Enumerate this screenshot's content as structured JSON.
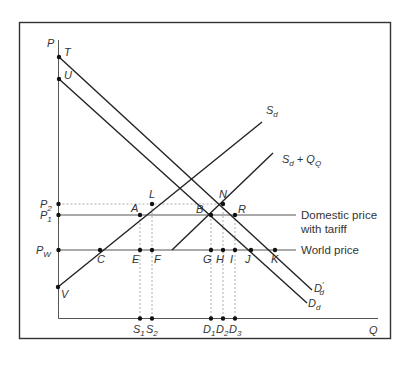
{
  "diagram": {
    "type": "tariff-quota-supply-demand",
    "axes": {
      "y_label": "P",
      "x_label": "Q"
    },
    "price_labels": [
      {
        "id": "P2",
        "main": "P",
        "sub": "2"
      },
      {
        "id": "P1",
        "main": "P",
        "sub": "1"
      },
      {
        "id": "Pw",
        "main": "P",
        "sub": "W"
      }
    ],
    "curve_labels": {
      "sd": {
        "main": "S",
        "sub": "d"
      },
      "sd_qo": {
        "main": "S",
        "sub": "d",
        "suffix": " + Q",
        "suffix_sub": "Q"
      },
      "dd": {
        "main": "D",
        "sub": "d"
      },
      "dd_prime": {
        "main": "D",
        "sub": "d",
        "prime": "′"
      }
    },
    "line_labels": {
      "domestic_price_line1": "Domestic price",
      "domestic_price_line2": "with tariff",
      "world_price": "World price"
    },
    "points": {
      "T": "T",
      "U": "U",
      "V": "V",
      "L": "L",
      "A": "A",
      "N": "N",
      "B": "B",
      "R": "R",
      "C": "C",
      "E": "E",
      "F": "F",
      "G": "G",
      "H": "H",
      "I": "I",
      "J": "J",
      "K": "K"
    },
    "quantity_labels": [
      {
        "id": "S1",
        "main": "S",
        "sub": "1"
      },
      {
        "id": "S2",
        "main": "S",
        "sub": "2"
      },
      {
        "id": "D1",
        "main": "D",
        "sub": "1"
      },
      {
        "id": "D2",
        "main": "D",
        "sub": "2"
      },
      {
        "id": "D3",
        "main": "D",
        "sub": "3"
      }
    ]
  }
}
